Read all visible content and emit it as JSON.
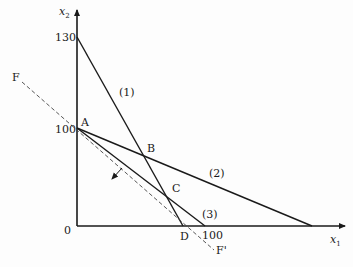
{
  "diagram": {
    "type": "linear-programming-feasible-region",
    "axes": {
      "x_label": "x",
      "x_sub": "1",
      "y_label": "x",
      "y_sub": "2",
      "origin_label": "0"
    },
    "tick_labels": {
      "y_130": "130",
      "y_100": "100",
      "x_100": "100"
    },
    "constraints": [
      {
        "id": "1",
        "label": "(1)"
      },
      {
        "id": "2",
        "label": "(2)"
      },
      {
        "id": "3",
        "label": "(3)"
      }
    ],
    "points": {
      "A": "A",
      "B": "B",
      "C": "C",
      "D": "D"
    },
    "objective_line": {
      "start_label": "F",
      "end_label": "F'"
    },
    "colors": {
      "line": "#1a1a1a",
      "dashed": "#444444",
      "background": "#fdfdfd"
    }
  }
}
